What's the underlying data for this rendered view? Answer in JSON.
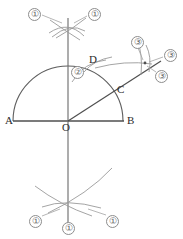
{
  "figure": {
    "type": "geometric-construction",
    "background_color": "#ffffff",
    "line_color": "#595959",
    "construction_arc_color": "#8d8d8d",
    "label_color": "#2b2b2b",
    "step_label_color": "#5d5d5d"
  },
  "points": [
    {
      "id": "A",
      "label": "A",
      "x": 14,
      "y": 121,
      "label_x": 5,
      "label_y": 116
    },
    {
      "id": "O",
      "label": "O",
      "x": 68,
      "y": 121,
      "label_x": 62,
      "label_y": 123
    },
    {
      "id": "B",
      "label": "B",
      "x": 124,
      "y": 121,
      "label_x": 127,
      "label_y": 116
    },
    {
      "id": "C",
      "label": "C",
      "x": 116,
      "y": 94,
      "label_x": 118,
      "label_y": 86
    },
    {
      "id": "D",
      "label": "D",
      "x": 93,
      "y": 64,
      "label_x": 90,
      "label_y": 56
    }
  ],
  "segments": [
    {
      "id": "baseline-AB",
      "from": "A",
      "to": "B"
    },
    {
      "id": "vertical-axis",
      "from_x": 68,
      "from_y": 18,
      "to_x": 68,
      "to_y": 230
    },
    {
      "id": "ray-OC-extended",
      "from_x": 68,
      "from_y": 121,
      "to_x": 160,
      "to_y": 62
    }
  ],
  "arcs": [
    {
      "id": "main-semicircle",
      "center": "O",
      "radius": 55,
      "start_angle": 180,
      "end_angle": 0
    }
  ],
  "step_labels": [
    {
      "id": "step-top-left",
      "text": "①",
      "x": 28,
      "y": 8
    },
    {
      "id": "step-top-right",
      "text": "①",
      "x": 88,
      "y": 8
    },
    {
      "id": "step-inside-arc",
      "text": "②",
      "x": 73,
      "y": 68
    },
    {
      "id": "step-right-top",
      "text": "③",
      "x": 131,
      "y": 37
    },
    {
      "id": "step-right-side",
      "text": "③",
      "x": 165,
      "y": 50
    },
    {
      "id": "step-right-bottom",
      "text": "③",
      "x": 155,
      "y": 72
    },
    {
      "id": "step-bottom-left",
      "text": "①",
      "x": 29,
      "y": 217
    },
    {
      "id": "step-bottom-center",
      "text": "①",
      "x": 62,
      "y": 223
    },
    {
      "id": "step-bottom-right",
      "text": "①",
      "x": 106,
      "y": 217
    }
  ]
}
